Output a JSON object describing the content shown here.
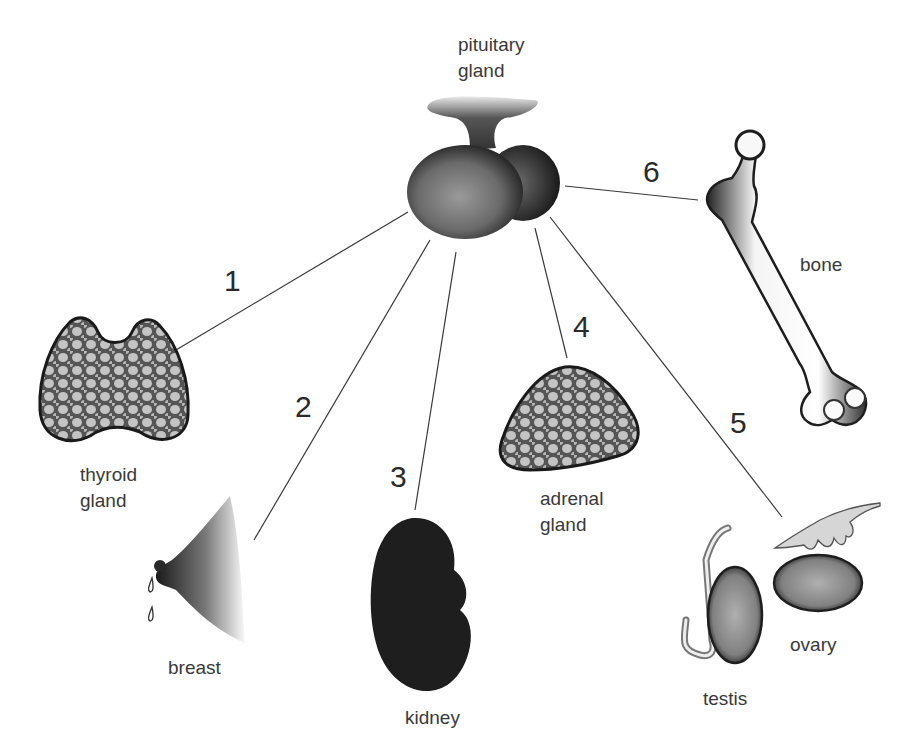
{
  "diagram": {
    "type": "hub-and-spoke",
    "hub": {
      "id": "pituitary",
      "label_line1": "pituitary",
      "label_line2": "gland"
    },
    "targets": [
      {
        "num": "1",
        "id": "thyroid",
        "label_line1": "thyroid",
        "label_line2": "gland"
      },
      {
        "num": "2",
        "id": "breast",
        "label_line1": "breast",
        "label_line2": ""
      },
      {
        "num": "3",
        "id": "kidney",
        "label_line1": "kidney",
        "label_line2": ""
      },
      {
        "num": "4",
        "id": "adrenal",
        "label_line1": "adrenal",
        "label_line2": "gland"
      },
      {
        "num": "5",
        "id": "gonads",
        "labels": [
          "testis",
          "ovary"
        ]
      },
      {
        "num": "6",
        "id": "bone",
        "label_line1": "bone",
        "label_line2": ""
      }
    ]
  },
  "labels": {
    "pituitary_1": "pituitary",
    "pituitary_2": "gland",
    "thyroid_1": "thyroid",
    "thyroid_2": "gland",
    "breast": "breast",
    "kidney": "kidney",
    "adrenal_1": "adrenal",
    "adrenal_2": "gland",
    "testis": "testis",
    "ovary": "ovary",
    "bone": "bone"
  },
  "numbers": {
    "n1": "1",
    "n2": "2",
    "n3": "3",
    "n4": "4",
    "n5": "5",
    "n6": "6"
  },
  "colors": {
    "line": "#3a3a3a",
    "organ_dark": "#1e1e1e",
    "organ_mid": "#6b6b6b",
    "cell_light": "#c8c8c8"
  }
}
